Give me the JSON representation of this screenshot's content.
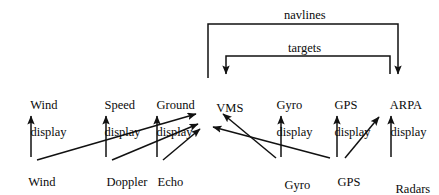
{
  "diagram": {
    "stroke_color": "#111111",
    "background_color": "#ffffff",
    "displays": [
      {
        "id": "wind-display",
        "line1": "Wind",
        "line2": "display",
        "x": 18,
        "y": 86
      },
      {
        "id": "speed-display",
        "line1": "Speed",
        "line2": "display",
        "x": 92,
        "y": 86
      },
      {
        "id": "ground-display",
        "line1": "Ground",
        "line2": "display",
        "x": 144,
        "y": 86
      },
      {
        "id": "vms",
        "line1": "VMS",
        "line2": "",
        "x": 204,
        "y": 89
      },
      {
        "id": "gyro-display",
        "line1": "Gyro",
        "line2": "display",
        "x": 264,
        "y": 86
      },
      {
        "id": "gps-display",
        "line1": "GPS",
        "line2": "display",
        "x": 322,
        "y": 86
      },
      {
        "id": "arpa-display",
        "line1": "ARPA",
        "line2": "display",
        "x": 378,
        "y": 86
      }
    ],
    "sensors": [
      {
        "id": "wind-measurement",
        "line1": "Wind",
        "line2": "measurement",
        "x": 16,
        "y": 163
      },
      {
        "id": "doppler-log",
        "line1": "Doppler",
        "line2": "log",
        "x": 94,
        "y": 163
      },
      {
        "id": "echo-sounder",
        "line1": "Echo",
        "line2": "sounder",
        "x": 145,
        "y": 163
      },
      {
        "id": "gyro",
        "line1": "Gyro",
        "line2": "",
        "x": 272,
        "y": 166
      },
      {
        "id": "gps-receiver",
        "line1": "GPS",
        "line2": "receiver",
        "x": 325,
        "y": 163
      },
      {
        "id": "radars",
        "line1": "Radars",
        "line2": "",
        "x": 383,
        "y": 170
      }
    ],
    "edge_labels": [
      {
        "id": "navlines",
        "text": "navlines",
        "x": 284,
        "y": 9,
        "from": "vms",
        "to": "arpa-display"
      },
      {
        "id": "targets",
        "text": "targets",
        "x": 288,
        "y": 42,
        "from": "arpa-display",
        "to": "vms"
      }
    ],
    "connections": [
      {
        "id": "wind-measurement-to-wind-display",
        "from": "wind-measurement",
        "to": "wind-display",
        "kind": "vertical"
      },
      {
        "id": "doppler-log-to-speed-display",
        "from": "doppler-log",
        "to": "speed-display",
        "kind": "vertical"
      },
      {
        "id": "echo-sounder-to-ground-display",
        "from": "echo-sounder",
        "to": "ground-display",
        "kind": "vertical"
      },
      {
        "id": "gyro-to-gyro-display",
        "from": "gyro",
        "to": "gyro-display",
        "kind": "vertical"
      },
      {
        "id": "gps-receiver-to-gps-display",
        "from": "gps-receiver",
        "to": "gps-display",
        "kind": "vertical"
      },
      {
        "id": "radars-to-arpa-display",
        "from": "radars",
        "to": "arpa-display",
        "kind": "vertical"
      },
      {
        "id": "wind-measurement-to-vms",
        "from": "wind-measurement",
        "to": "vms",
        "kind": "diagonal"
      },
      {
        "id": "doppler-log-to-vms",
        "from": "doppler-log",
        "to": "vms",
        "kind": "diagonal"
      },
      {
        "id": "echo-sounder-to-vms",
        "from": "echo-sounder",
        "to": "vms",
        "kind": "diagonal"
      },
      {
        "id": "gyro-to-vms",
        "from": "gyro",
        "to": "vms",
        "kind": "diagonal"
      },
      {
        "id": "gps-receiver-to-vms",
        "from": "gps-receiver",
        "to": "vms",
        "kind": "diagonal"
      },
      {
        "id": "gps-receiver-to-arpa-display",
        "from": "gps-receiver",
        "to": "arpa-display",
        "kind": "diagonal"
      },
      {
        "id": "vms-to-arpa-navlines",
        "from": "vms",
        "to": "arpa-display",
        "kind": "orthogonal",
        "label": "navlines"
      },
      {
        "id": "arpa-to-vms-targets",
        "from": "arpa-display",
        "to": "vms",
        "kind": "orthogonal",
        "label": "targets"
      }
    ]
  }
}
